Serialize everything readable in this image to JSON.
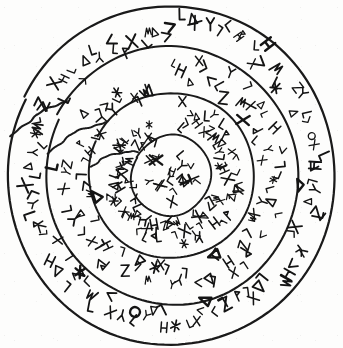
{
  "figure": {
    "name": "inscribed-spiral-disc",
    "title": "",
    "caption": "",
    "medium": "ink line drawing, black on white",
    "background_color": "#fdfdfc",
    "ink_color": "#141414",
    "canvas": {
      "width": 343,
      "height": 348
    }
  },
  "disc": {
    "center": {
      "x": 171,
      "y": 176
    },
    "outer_radius": 166,
    "coil_count": 4,
    "coil_radii": [
      166,
      128,
      83,
      39
    ],
    "spiral_direction": "inward-clockwise",
    "line_width": 2.1,
    "break_angle_deg": 208
  },
  "rings": [
    {
      "index": 0,
      "name": "outer-ring",
      "label": "Outer band",
      "radius_outer": 166,
      "radius_inner": 128,
      "glyph_count": 96
    },
    {
      "index": 1,
      "name": "second-ring",
      "label": "Second band",
      "radius_outer": 128,
      "radius_inner": 83,
      "glyph_count": 84
    },
    {
      "index": 2,
      "name": "third-ring",
      "label": "Third band",
      "radius_outer": 83,
      "radius_inner": 39,
      "glyph_count": 92
    },
    {
      "index": 3,
      "name": "core-disc",
      "label": "Central field",
      "radius_outer": 39,
      "radius_inner": 0,
      "glyph_count": 17
    }
  ],
  "glyph_alphabet": [
    {
      "id": "lamed",
      "name": "hook-glyph",
      "form": "L"
    },
    {
      "id": "triangle",
      "name": "triangle-glyph",
      "form": "delta"
    },
    {
      "id": "arrow",
      "name": "arrowhead-glyph",
      "form": "chevron"
    },
    {
      "id": "gimel",
      "name": "bent-rod-glyph",
      "form": "gamma"
    },
    {
      "id": "het",
      "name": "ladder-glyph",
      "form": "H"
    },
    {
      "id": "tav",
      "name": "cross-glyph",
      "form": "X"
    },
    {
      "id": "zayin",
      "name": "zigzag-glyph",
      "form": "Z"
    },
    {
      "id": "kaf",
      "name": "fork-glyph",
      "form": "trident"
    },
    {
      "id": "mem",
      "name": "wave-glyph",
      "form": "M"
    },
    {
      "id": "ayin",
      "name": "ring-glyph",
      "form": "O"
    },
    {
      "id": "shin",
      "name": "star-glyph",
      "form": "asterisk"
    },
    {
      "id": "vav",
      "name": "stem-glyph",
      "form": "Y"
    },
    {
      "id": "bet",
      "name": "flag-glyph",
      "form": "P"
    },
    {
      "id": "dalet",
      "name": "wedge-glyph",
      "form": "D"
    },
    {
      "id": "samekh",
      "name": "comb-glyph",
      "form": "E"
    },
    {
      "id": "qof",
      "name": "loop-stem-glyph",
      "form": "Q"
    }
  ],
  "glyph_rows": [
    {
      "ring": 0,
      "start_angle_deg": -95,
      "end_angle_deg": 262,
      "radius": 147,
      "sequence": "triangle arrow lamed triangle tav vav lamed gimel het bet lamed tav arrow mem lamed shin zayin kaf triangle lamed gimel ayin tav lamed het arrow lamed vav triangle zayin lamed tav gimel kaf lamed arrow het mem lamed triangle tav lamed bet zayin lamed gimel arrow tav lamed shin het lamed triangle kaf lamed vav tav arrow lamed mem gimel lamed zayin triangle lamed het tav lamed arrow bet lamed kaf gimel tav lamed triangle vav lamed shin mem lamed arrow zayin lamed tav het lamed gimel triangle lamed kaf arrow lamed bet tav lamed mem"
    },
    {
      "ring": 1,
      "start_angle_deg": -88,
      "end_angle_deg": 255,
      "radius": 107,
      "sequence": "lamed het triangle tav gimel arrow lamed kaf zayin lamed mem tav triangle lamed bet het lamed vav arrow tav lamed gimel shin lamed triangle kaf lamed tav mem arrow lamed zayin bet lamed het tav gimel lamed triangle arrow lamed kaf vav lamed tav shin mem lamed triangle zayin lamed bet arrow het lamed tav gimel lamed kaf triangle lamed mem tav arrow lamed vav zayin lamed het bet lamed tav triangle gimel lamed arrow kaf lamed shin tav lamed mem triangle"
    },
    {
      "ring": 2,
      "start_angle_deg": -82,
      "end_angle_deg": 248,
      "radius": 62,
      "sequence": "tav lamed gimel arrow triangle het lamed kaf tav zayin lamed mem bet lamed triangle vav tav lamed arrow shin lamed het gimel tav lamed triangle kaf lamed zayin mem tav lamed bet arrow lamed het triangle tav gimel lamed vav kaf lamed tav shin mem lamed arrow triangle zayin lamed bet het lamed tav kaf gimel lamed triangle mem lamed arrow tav vav lamed shin zayin lamed het triangle bet lamed tav gimel kaf lamed arrow mem lamed triangle tav het lamed zayin bet lamed vav tav lamed gimel shin"
    },
    {
      "ring": 3,
      "start_angle_deg": -60,
      "end_angle_deg": 300,
      "radius": 20,
      "sequence": "tav lamed gimel het lamed tav kaf lamed triangle vav lamed tav arrow lamed zayin tav lamed"
    }
  ],
  "annotations": {
    "visible_text": "none",
    "numbering": "none",
    "scale_bar": "none"
  }
}
